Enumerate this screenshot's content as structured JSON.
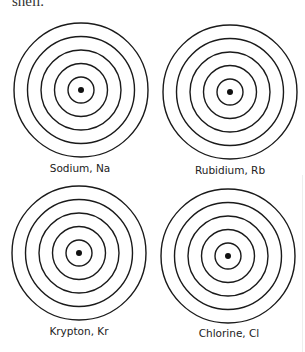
{
  "caption_fragment": "shell.",
  "atoms": [
    {
      "name": "Sodium",
      "symbol": "Na",
      "label": "Sodium, Na",
      "shells": 5
    },
    {
      "name": "Rubidium",
      "symbol": "Rb",
      "label": "Rubidium, Rb",
      "shells": 5
    },
    {
      "name": "Krypton",
      "symbol": "Kr",
      "label": "Krypton, Kr",
      "shells": 5
    },
    {
      "name": "Chlorine",
      "symbol": "Cl",
      "label": "Chlorine, Cl",
      "shells": 5
    }
  ],
  "colors": {
    "line": "#1a1a1a",
    "nucleus": "#111111",
    "text": "#222222"
  }
}
